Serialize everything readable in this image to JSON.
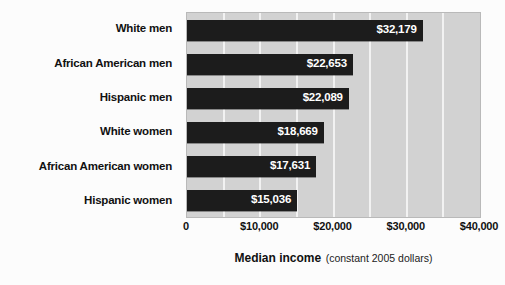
{
  "chart_data": {
    "type": "bar",
    "orientation": "horizontal",
    "title": "",
    "xlabel": "Median income (constant 2005 dollars)",
    "xlabel_main": "Median income",
    "xlabel_sub": "(constant 2005 dollars)",
    "ylabel": "",
    "categories": [
      "White men",
      "African American men",
      "Hispanic men",
      "White women",
      "African American women",
      "Hispanic women"
    ],
    "values": [
      32179,
      22653,
      22089,
      18669,
      17631,
      15036
    ],
    "value_labels": [
      "$32,179",
      "$22,653",
      "$22,089",
      "$18,669",
      "$17,631",
      "$15,036"
    ],
    "xlim": [
      0,
      40000
    ],
    "xticks": [
      0,
      10000,
      20000,
      30000,
      40000
    ],
    "xtick_labels": [
      "0",
      "$10,000",
      "$20,000",
      "$30,000",
      "$40,000"
    ],
    "gridlines": [
      5000,
      10000,
      15000,
      20000,
      25000,
      30000,
      35000
    ],
    "grid": true,
    "legend": "none",
    "colors": {
      "bar": "#1c1c1c",
      "plot_background": "#d2d2d2",
      "gridline": "#f2f2f2",
      "page_background": "#fcfcfc",
      "label_text": "#111111",
      "value_text": "#ffffff"
    }
  }
}
